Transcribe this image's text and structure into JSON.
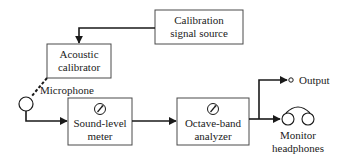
{
  "diagram": {
    "type": "block-diagram",
    "colors": {
      "line": "#1a1a1a",
      "box_border": "#4a4a4a",
      "text": "#222222",
      "background": "#ffffff"
    },
    "blocks": [
      {
        "id": "calibration-signal-source",
        "line1": "Calibration",
        "line2": "signal source"
      },
      {
        "id": "acoustic-calibrator",
        "line1": "Acoustic",
        "line2": "calibrator"
      },
      {
        "id": "sound-level-meter",
        "line1": "Sound-level",
        "line2": "meter",
        "icon": "meter-dial-icon"
      },
      {
        "id": "octave-band-analyzer",
        "line1": "Octave-band",
        "line2": "analyzer",
        "icon": "meter-dial-icon"
      }
    ],
    "nodes": {
      "microphone": {
        "label": "Microphone"
      },
      "output": {
        "label": "Output"
      },
      "headphones": {
        "line1": "Monitor",
        "line2": "headphones"
      }
    },
    "connections": [
      {
        "from": "calibration-signal-source",
        "to": "acoustic-calibrator",
        "style": "solid-arrow"
      },
      {
        "from": "acoustic-calibrator",
        "to": "microphone",
        "style": "dashed"
      },
      {
        "from": "microphone",
        "to": "sound-level-meter",
        "style": "solid-arrow"
      },
      {
        "from": "sound-level-meter",
        "to": "octave-band-analyzer",
        "style": "solid-arrow"
      },
      {
        "from": "octave-band-analyzer",
        "to": "output",
        "style": "solid-arrow"
      },
      {
        "from": "octave-band-analyzer",
        "to": "headphones",
        "style": "solid-arrow"
      }
    ]
  }
}
